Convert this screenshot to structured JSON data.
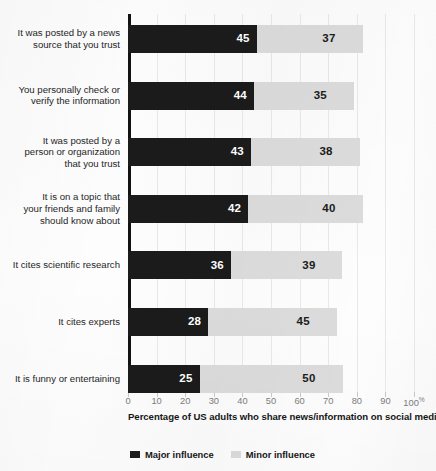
{
  "chart_data": {
    "type": "bar",
    "orientation": "horizontal",
    "stacked": true,
    "title": "",
    "xlabel": "Percentage of US adults who share news/information on social media",
    "ylabel": "",
    "xlim": [
      0,
      100
    ],
    "grid": true,
    "legend_position": "bottom-left",
    "x_ticks": [
      "0",
      "10",
      "20",
      "30",
      "40",
      "50",
      "60",
      "70",
      "80",
      "90",
      "100"
    ],
    "x_tick_suffix": "%",
    "x_tick_last_label": "100%",
    "categories": [
      "It was posted by a news\nsource that you trust",
      "You personally check or\nverify the information",
      "It was posted by a\nperson or organization\nthat you trust",
      "It is on a topic that\nyour friends and family\nshould know about",
      "It cites scientific research",
      "It cites experts",
      "It is funny or entertaining"
    ],
    "series": [
      {
        "name": "Major influence",
        "color": "#1b1b1b",
        "values": [
          45,
          44,
          43,
          42,
          36,
          28,
          25
        ]
      },
      {
        "name": "Minor influence",
        "color": "#dcdcdc",
        "values": [
          37,
          35,
          38,
          40,
          39,
          45,
          50
        ]
      }
    ],
    "totals": [
      82,
      79,
      81,
      82,
      75,
      73,
      75
    ]
  },
  "colors": {
    "major": "#1b1b1b",
    "minor": "#dcdcdc",
    "axis": "#121212",
    "gridline": "#e9e9e9",
    "tick_text": "#7c7c7c",
    "background": "#fdfdfd"
  }
}
